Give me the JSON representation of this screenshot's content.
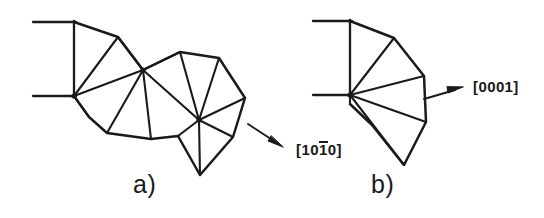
{
  "figure": {
    "background_color": "#ffffff",
    "line_color": "#1a1a1a",
    "panels": [
      {
        "id": "a",
        "label": "a)",
        "description": "chain of triangulated fan sectors with three hub vertices",
        "hubs": [
          [
            74,
            96
          ],
          [
            143,
            70
          ],
          [
            199,
            120
          ]
        ],
        "reference_lines": [
          {
            "from": [
              33,
              22
            ],
            "to": [
              74,
              22
            ]
          },
          {
            "from": [
              33,
              96
            ],
            "to": [
              74,
              96
            ]
          },
          {
            "from": [
              74,
              22
            ],
            "to": [
              74,
              96
            ]
          }
        ],
        "outline": [
          [
            74,
            22
          ],
          [
            118,
            37
          ],
          [
            143,
            70
          ],
          [
            180,
            52
          ],
          [
            219,
            58
          ],
          [
            245,
            98
          ],
          [
            233,
            137
          ],
          [
            200,
            175
          ],
          [
            178,
            136
          ],
          [
            151,
            139
          ],
          [
            107,
            133
          ],
          [
            89,
            117
          ],
          [
            74,
            96
          ]
        ],
        "spokes": [
          {
            "from": [
              74,
              96
            ],
            "to": [
              74,
              22
            ]
          },
          {
            "from": [
              74,
              96
            ],
            "to": [
              118,
              37
            ]
          },
          {
            "from": [
              74,
              96
            ],
            "to": [
              143,
              70
            ]
          },
          {
            "from": [
              74,
              96
            ],
            "to": [
              89,
              117
            ]
          },
          {
            "from": [
              143,
              70
            ],
            "to": [
              118,
              37
            ]
          },
          {
            "from": [
              143,
              70
            ],
            "to": [
              107,
              133
            ]
          },
          {
            "from": [
              143,
              70
            ],
            "to": [
              151,
              139
            ]
          },
          {
            "from": [
              143,
              70
            ],
            "to": [
              180,
              52
            ]
          },
          {
            "from": [
              143,
              70
            ],
            "to": [
              199,
              120
            ]
          },
          {
            "from": [
              199,
              120
            ],
            "to": [
              180,
              52
            ]
          },
          {
            "from": [
              199,
              120
            ],
            "to": [
              219,
              58
            ]
          },
          {
            "from": [
              199,
              120
            ],
            "to": [
              245,
              98
            ]
          },
          {
            "from": [
              199,
              120
            ],
            "to": [
              233,
              137
            ]
          },
          {
            "from": [
              199,
              120
            ],
            "to": [
              178,
              136
            ]
          },
          {
            "from": [
              199,
              120
            ],
            "to": [
              200,
              175
            ]
          }
        ],
        "arrow": {
          "from": [
            248,
            124
          ],
          "to": [
            282,
            146
          ]
        },
        "arrow_label": "[1010]",
        "arrow_label_parts": {
          "pre": "[10",
          "bar": "1",
          "post": "0]"
        }
      },
      {
        "id": "b",
        "label": "b)",
        "description": "single triangulated fan sector from one hub vertex",
        "hubs": [
          [
            350,
            95
          ]
        ],
        "reference_lines": [
          {
            "from": [
              313,
              21
            ],
            "to": [
              350,
              21
            ]
          },
          {
            "from": [
              313,
              95
            ],
            "to": [
              350,
              95
            ]
          },
          {
            "from": [
              350,
              21
            ],
            "to": [
              350,
              95
            ]
          }
        ],
        "outline": [
          [
            350,
            21
          ],
          [
            394,
            38
          ],
          [
            424,
            76
          ],
          [
            426,
            122
          ],
          [
            404,
            165
          ],
          [
            372,
            125
          ],
          [
            350,
            104
          ],
          [
            350,
            95
          ]
        ],
        "spokes": [
          {
            "from": [
              350,
              95
            ],
            "to": [
              350,
              21
            ]
          },
          {
            "from": [
              350,
              95
            ],
            "to": [
              394,
              38
            ]
          },
          {
            "from": [
              350,
              95
            ],
            "to": [
              424,
              76
            ]
          },
          {
            "from": [
              350,
              95
            ],
            "to": [
              426,
              122
            ]
          },
          {
            "from": [
              350,
              95
            ],
            "to": [
              404,
              165
            ]
          }
        ],
        "arrow": {
          "from": [
            424,
            98
          ],
          "to": [
            462,
            87
          ]
        },
        "arrow_label": "[0001]",
        "arrow_label_parts": {
          "pre": "[0001]",
          "bar": "",
          "post": ""
        }
      }
    ]
  },
  "labels": {
    "panel_a": "a)",
    "panel_b": "b)",
    "miller_1010_pre": "[10",
    "miller_1010_bar": "1",
    "miller_1010_post": "0]",
    "miller_0001": "[0001]"
  }
}
